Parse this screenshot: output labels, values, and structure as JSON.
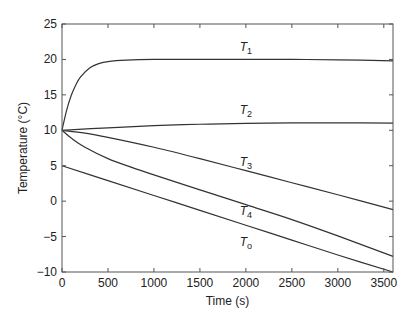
{
  "chart_data": {
    "type": "line",
    "title": "",
    "xlabel": "Time (s)",
    "ylabel": "Temperature (°C)",
    "xlim": [
      0,
      3600
    ],
    "ylim": [
      -10,
      25
    ],
    "xticks": [
      0,
      500,
      1000,
      1500,
      2000,
      2500,
      3000,
      3500
    ],
    "xtick_labels": [
      "0",
      "500",
      "1000",
      "1500",
      "2000",
      "2500",
      "3000",
      "3500"
    ],
    "yticks": [
      -10,
      -5,
      0,
      5,
      10,
      15,
      20,
      25
    ],
    "ytick_labels": [
      "−10",
      "−5",
      "0",
      "5",
      "10",
      "15",
      "20",
      "25"
    ],
    "grid": false,
    "legend": "none (inline labels)",
    "series": [
      {
        "name": "T1",
        "label_main": "T",
        "label_sub": "1",
        "label_at": [
          2000,
          21.2
        ],
        "x": [
          0,
          50,
          100,
          150,
          200,
          300,
          400,
          500,
          700,
          1000,
          1500,
          2000,
          2500,
          3000,
          3600
        ],
        "y": [
          10,
          12.8,
          14.9,
          16.4,
          17.5,
          18.8,
          19.4,
          19.7,
          19.9,
          20.0,
          20.0,
          20.0,
          20.0,
          19.95,
          19.8
        ]
      },
      {
        "name": "T2",
        "label_main": "T",
        "label_sub": "2",
        "label_at": [
          2000,
          12.3
        ],
        "x": [
          0,
          500,
          1000,
          1500,
          2000,
          2500,
          3000,
          3600
        ],
        "y": [
          10,
          10.35,
          10.65,
          10.85,
          10.98,
          11.05,
          11.05,
          11.0
        ]
      },
      {
        "name": "T3",
        "label_main": "T",
        "label_sub": "3",
        "label_at": [
          2000,
          5.0
        ],
        "x": [
          0,
          250,
          500,
          1000,
          1500,
          2000,
          2500,
          3000,
          3600
        ],
        "y": [
          10,
          9.6,
          9.0,
          7.6,
          6.0,
          4.3,
          2.6,
          0.9,
          -1.2
        ]
      },
      {
        "name": "T4",
        "label_main": "T",
        "label_sub": "4",
        "label_at": [
          2000,
          -1.9
        ],
        "x": [
          0,
          100,
          250,
          500,
          750,
          1000,
          1500,
          2000,
          2500,
          3000,
          3600
        ],
        "y": [
          10,
          8.9,
          7.6,
          6.0,
          4.8,
          3.7,
          1.6,
          -0.5,
          -2.6,
          -4.9,
          -7.8
        ]
      },
      {
        "name": "To",
        "label_main": "T",
        "label_sub": "o",
        "label_at": [
          2000,
          -6.3
        ],
        "x": [
          0,
          500,
          1000,
          1500,
          2000,
          2500,
          3000,
          3600
        ],
        "y": [
          5,
          2.9,
          0.8,
          -1.3,
          -3.4,
          -5.5,
          -7.6,
          -10.0
        ]
      }
    ]
  }
}
